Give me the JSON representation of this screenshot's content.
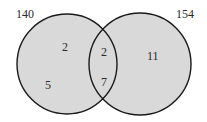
{
  "diagram": {
    "type": "venn",
    "fill_color": "#d9d9d9",
    "stroke_color": "#1a1a1a",
    "sets": [
      {
        "name": "left",
        "label": "140"
      },
      {
        "name": "right",
        "label": "154"
      }
    ],
    "regions": {
      "left_only": [
        "2",
        "5"
      ],
      "intersection": [
        "2",
        "7"
      ],
      "right_only": [
        "11"
      ]
    }
  }
}
